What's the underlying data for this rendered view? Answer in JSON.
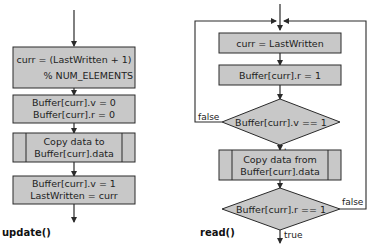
{
  "colors": {
    "box_fill": "#c8c8c8",
    "stroke": "#2a2a2a",
    "background": "#ffffff"
  },
  "update": {
    "title": "update()",
    "boxes": [
      {
        "type": "process",
        "lines": [
          "curr = (LastWritten + 1)",
          "% NUM_ELEMENTS"
        ]
      },
      {
        "type": "process",
        "lines": [
          "Buffer[curr].v = 0",
          "Buffer[curr].r = 0"
        ]
      },
      {
        "type": "predefined-process",
        "lines": [
          "Copy data to",
          "Buffer[curr].data"
        ]
      },
      {
        "type": "process",
        "lines": [
          "Buffer[curr].v = 1",
          "LastWritten = curr"
        ]
      }
    ]
  },
  "read": {
    "title": "read()",
    "boxes": [
      {
        "type": "process",
        "lines": [
          "curr = LastWritten"
        ]
      },
      {
        "type": "process",
        "lines": [
          "Buffer[curr].r = 1"
        ]
      },
      {
        "type": "decision",
        "lines": [
          "Buffer[curr].v == 1"
        ],
        "false_label": "false",
        "true_label": "true"
      },
      {
        "type": "predefined-process",
        "lines": [
          "Copy data from",
          "Buffer[curr].data"
        ]
      },
      {
        "type": "decision",
        "lines": [
          "Buffer[curr].r == 1"
        ],
        "false_label": "false",
        "true_label": "true"
      }
    ]
  }
}
